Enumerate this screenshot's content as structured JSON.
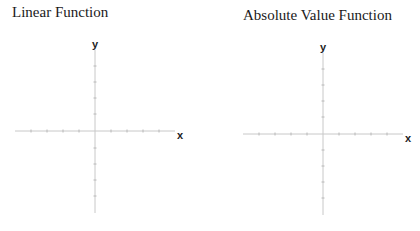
{
  "graphs": [
    {
      "title": "Linear Function",
      "x_label": "x",
      "y_label": "y"
    },
    {
      "title": "Absolute Value Function",
      "x_label": "x",
      "y_label": "y"
    }
  ],
  "colors": {
    "axis": "#c8c8c8",
    "tick": "#b8b8b8",
    "label": "#222222",
    "title": "#1a1a1a"
  }
}
